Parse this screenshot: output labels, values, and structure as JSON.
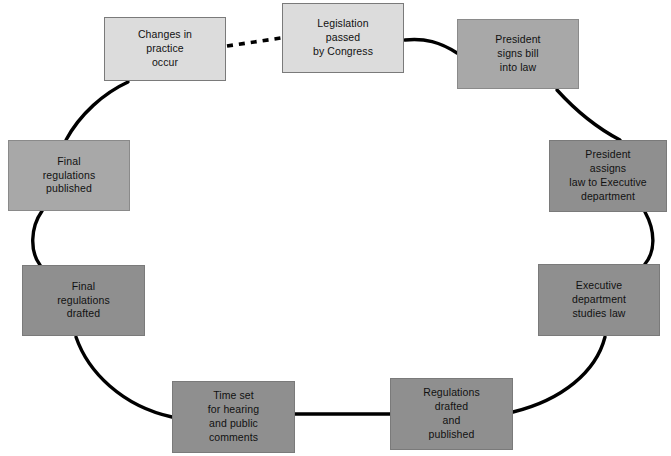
{
  "diagram": {
    "type": "cycle-flowchart",
    "background_color": "#ffffff",
    "line_color": "#000000",
    "nodes": [
      {
        "id": "legislation-passed",
        "label": "Legislation\npassed\nby Congress",
        "shade": "light",
        "fill": "#dcdcdc",
        "x": 282,
        "y": 3,
        "w": 122,
        "h": 70
      },
      {
        "id": "president-signs",
        "label": "President\nsigns bill\ninto law",
        "shade": "mid",
        "fill": "#a8a8a8",
        "x": 457,
        "y": 19,
        "w": 122,
        "h": 70
      },
      {
        "id": "president-assigns",
        "label": "President\nassigns\nlaw to Executive\ndepartment",
        "shade": "dark",
        "fill": "#8f8f8f",
        "x": 549,
        "y": 140,
        "w": 118,
        "h": 72
      },
      {
        "id": "executive-studies",
        "label": "Executive\ndepartment\nstudies law",
        "shade": "dark",
        "fill": "#8f8f8f",
        "x": 538,
        "y": 264,
        "w": 122,
        "h": 72
      },
      {
        "id": "regulations-drafted-published",
        "label": "Regulations\ndrafted\nand\npublished",
        "shade": "dark",
        "fill": "#8f8f8f",
        "x": 390,
        "y": 378,
        "w": 123,
        "h": 72
      },
      {
        "id": "time-set-hearing",
        "label": "Time set\nfor hearing\nand public\ncomments",
        "shade": "dark",
        "fill": "#8f8f8f",
        "x": 172,
        "y": 381,
        "w": 123,
        "h": 72
      },
      {
        "id": "final-regulations-drafted",
        "label": "Final\nregulations\ndrafted",
        "shade": "dark",
        "fill": "#8f8f8f",
        "x": 22,
        "y": 265,
        "w": 123,
        "h": 71
      },
      {
        "id": "final-regulations-published",
        "label": "Final\nregulations\npublished",
        "shade": "mid",
        "fill": "#a8a8a8",
        "x": 8,
        "y": 140,
        "w": 122,
        "h": 71
      },
      {
        "id": "changes-in-practice",
        "label": "Changes in\npractice\noccur",
        "shade": "light",
        "fill": "#dcdcdc",
        "x": 104,
        "y": 17,
        "w": 122,
        "h": 64
      }
    ],
    "connectors": [
      {
        "id": "changes-to-legislation",
        "from": "changes-in-practice",
        "to": "legislation-passed",
        "style": "dashed"
      },
      {
        "id": "legislation-to-signs",
        "from": "legislation-passed",
        "to": "president-signs",
        "style": "curve"
      },
      {
        "id": "signs-to-assigns",
        "from": "president-signs",
        "to": "president-assigns",
        "style": "curve"
      },
      {
        "id": "assigns-to-studies",
        "from": "president-assigns",
        "to": "executive-studies",
        "style": "curve"
      },
      {
        "id": "studies-to-regulations",
        "from": "executive-studies",
        "to": "regulations-drafted-published",
        "style": "curve"
      },
      {
        "id": "regulations-to-time",
        "from": "regulations-drafted-published",
        "to": "time-set-hearing",
        "style": "straight"
      },
      {
        "id": "time-to-final-drafted",
        "from": "time-set-hearing",
        "to": "final-regulations-drafted",
        "style": "curve"
      },
      {
        "id": "final-drafted-to-published",
        "from": "final-regulations-drafted",
        "to": "final-regulations-published",
        "style": "curve"
      },
      {
        "id": "final-published-to-changes",
        "from": "final-regulations-published",
        "to": "changes-in-practice",
        "style": "curve"
      }
    ]
  }
}
